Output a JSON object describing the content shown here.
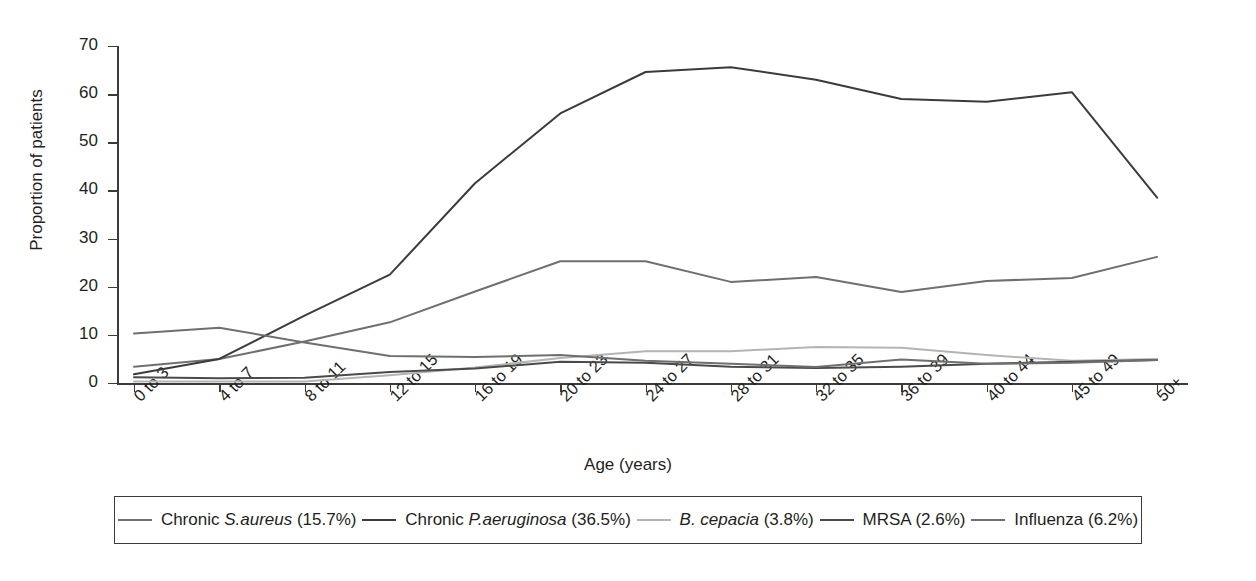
{
  "chart_data": {
    "type": "line",
    "title": "",
    "xlabel": "Age (years)",
    "ylabel": "Proportion of patients",
    "ylim": [
      0,
      70
    ],
    "yticks": [
      0,
      10,
      20,
      30,
      40,
      50,
      60,
      70
    ],
    "grid": false,
    "legend_position": "bottom",
    "categories": [
      "0 to 3",
      "4 to 7",
      "8 to 11",
      "12 to 15",
      "16 to 19",
      "20 to 23",
      "24 to 27",
      "28 to 31",
      "32 to 35",
      "36 to 39",
      "40 to 44",
      "45 to 49",
      "50+"
    ],
    "series": [
      {
        "name": "Chronic S.aureus (15.7%)",
        "label_plain": "Chronic",
        "label_italic": "S.aureus",
        "label_tail": "(15.7%)",
        "color": "#6f6f6f",
        "values": [
          3.4,
          5.0,
          8.6,
          12.6,
          19.0,
          25.3,
          25.3,
          21.0,
          22.0,
          18.9,
          21.2,
          21.8,
          26.2
        ]
      },
      {
        "name": "Chronic P.aeruginosa (36.5%)",
        "label_plain": "Chronic",
        "label_italic": "P.aeruginosa",
        "label_tail": "(36.5%)",
        "color": "#3b3b3b",
        "values": [
          1.8,
          5.0,
          14.0,
          22.5,
          41.5,
          56.0,
          64.6,
          65.6,
          63.0,
          59.0,
          58.4,
          60.4,
          38.5
        ]
      },
      {
        "name": "B. cepacia (3.8%)",
        "label_plain": "",
        "label_italic": "B. cepacia",
        "label_tail": "(3.8%)",
        "color": "#b4b4b4",
        "values": [
          0.3,
          0.3,
          0.3,
          1.6,
          3.2,
          5.2,
          6.6,
          6.6,
          7.5,
          7.3,
          5.8,
          4.6,
          5.0
        ]
      },
      {
        "name": "MRSA (2.6%)",
        "label_plain": "",
        "label_italic": "",
        "label_tail": "MRSA (2.6%)",
        "color": "#4a4a4a",
        "values": [
          1.2,
          1.0,
          1.1,
          2.3,
          3.0,
          4.4,
          4.2,
          3.4,
          3.1,
          3.4,
          4.0,
          4.4,
          4.8
        ]
      },
      {
        "name": "Influenza (6.2%)",
        "label_plain": "",
        "label_italic": "",
        "label_tail": "Influenza (6.2%)",
        "color": "#6f6f6f",
        "values": [
          10.3,
          11.5,
          8.4,
          5.6,
          5.4,
          5.8,
          4.6,
          4.0,
          3.3,
          4.9,
          4.0,
          4.2,
          4.8
        ]
      }
    ]
  }
}
